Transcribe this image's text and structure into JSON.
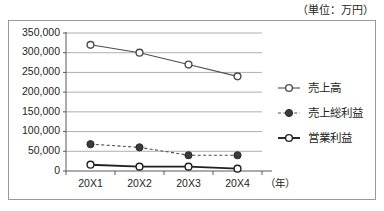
{
  "caption": {
    "unit_note": "（単位：万円）"
  },
  "chart_data": {
    "type": "line",
    "title": "",
    "subtitle": "",
    "xlabel": "（年）",
    "ylabel": "",
    "unit_note": "（単位：万円）",
    "categories": [
      "20X1",
      "20X2",
      "20X3",
      "20X4"
    ],
    "ylim": [
      0,
      350000
    ],
    "ytick_interval": 50000,
    "ytick_labels": [
      "0",
      "50,000",
      "100,000",
      "150,000",
      "200,000",
      "250,000",
      "300,000",
      "350,000"
    ],
    "ytick_values": [
      0,
      50000,
      100000,
      150000,
      200000,
      250000,
      300000,
      350000
    ],
    "grid": true,
    "legend_position": "right",
    "series": [
      {
        "name": "売上高",
        "values": [
          320000,
          300000,
          270000,
          240000
        ],
        "line_style": "solid",
        "marker": "open-circle",
        "color": "#4d4d4d"
      },
      {
        "name": "売上総利益",
        "values": [
          68000,
          60000,
          40000,
          40000
        ],
        "line_style": "dashed",
        "marker": "filled-circle",
        "color": "#4d4d4d"
      },
      {
        "name": "営業利益",
        "values": [
          16000,
          11000,
          11000,
          6000
        ],
        "line_style": "solid-bold",
        "marker": "open-circle",
        "color": "#231f20"
      }
    ]
  },
  "colors": {
    "frame_border": "#9a9a9a",
    "gridline": "#9a9a9a",
    "axis": "#595959",
    "text": "#231f20",
    "background": "#ffffff"
  }
}
